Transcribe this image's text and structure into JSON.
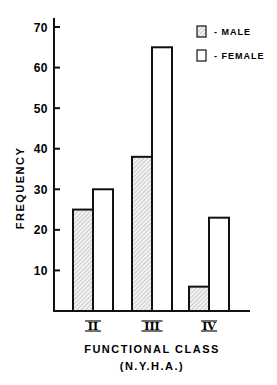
{
  "chart_data": {
    "type": "bar",
    "title": "",
    "xlabel": "FUNCTIONAL CLASS",
    "xlabel_sub": "(N.Y.H.A.)",
    "ylabel": "FREQUENCY",
    "categories": [
      "II",
      "III",
      "IV"
    ],
    "series": [
      {
        "name": "MALE",
        "pattern": "hatched",
        "values": [
          25,
          38,
          6
        ]
      },
      {
        "name": "FEMALE",
        "pattern": "open",
        "values": [
          30,
          65,
          23
        ]
      }
    ],
    "ylim": [
      0,
      70
    ],
    "yticks": [
      10,
      20,
      30,
      40,
      50,
      60,
      70
    ],
    "grid": false,
    "legend_position": "top-right"
  },
  "legend": {
    "male_label": "- MALE",
    "female_label": "- FEMALE"
  },
  "colors": {
    "ink": "#111111",
    "hatch_bg": "#f2f2f2",
    "background": "#ffffff"
  }
}
